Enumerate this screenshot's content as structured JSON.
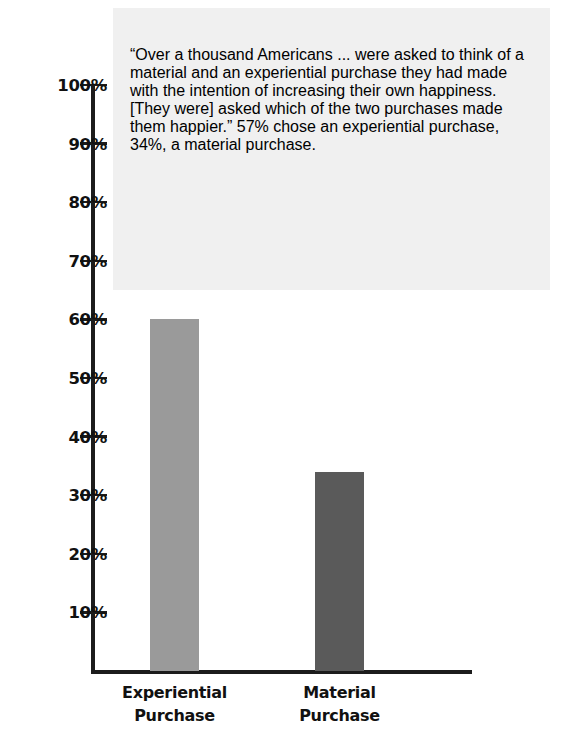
{
  "annotation": {
    "text": "“Over a thousand Americans ... were asked to think of a material and an experiential purchase they had made with the intention of increasing their own happiness. [They were] asked which of the two purchases made them happier.”  57% chose an experiential purchase, 34%, a material purchase.",
    "background_color": "#f0f0f0"
  },
  "chart_data": {
    "type": "bar",
    "title": "",
    "xlabel": "",
    "ylabel": "",
    "categories": [
      "Experiential Purchase",
      "Material Purchase"
    ],
    "category_lines": [
      [
        "Experiential",
        "Purchase"
      ],
      [
        "Material",
        "Purchase"
      ]
    ],
    "values": [
      60,
      34
    ],
    "value_labels": [
      "60%",
      "34%"
    ],
    "ylim": [
      0,
      100
    ],
    "grid": false,
    "legend": "none",
    "y_ticks": [
      100,
      90,
      80,
      70,
      60,
      50,
      40,
      30,
      20,
      10
    ],
    "y_tick_labels": [
      "100%",
      "90%",
      "80%",
      "70%",
      "60%",
      "50%",
      "40%",
      "30%",
      "20%",
      "10%"
    ],
    "bar_colors": [
      "#9a9a9a",
      "#5a5a5a"
    ],
    "axis_color": "#1c1c1c"
  }
}
